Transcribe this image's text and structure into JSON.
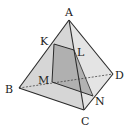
{
  "diagram": {
    "type": "tetrahedron-cross-section",
    "vertices": {
      "A": {
        "label": "A",
        "x": 69,
        "y": 20
      },
      "B": {
        "label": "B",
        "x": 19,
        "y": 88
      },
      "C": {
        "label": "C",
        "x": 84,
        "y": 110
      },
      "D": {
        "label": "D",
        "x": 113,
        "y": 74
      }
    },
    "section_points": {
      "K": {
        "label": "K",
        "on": "AB",
        "x": 54,
        "y": 44
      },
      "L": {
        "label": "L",
        "on": "AC",
        "x": 74,
        "y": 50
      },
      "N": {
        "label": "N",
        "on": "CD",
        "x": 93,
        "y": 96
      },
      "M": {
        "label": "M",
        "on": "BD",
        "x": 52,
        "y": 82
      }
    },
    "section": [
      "K",
      "L",
      "N",
      "M"
    ],
    "hidden_edges": [
      "BD"
    ],
    "colors": {
      "face": "#d8d8d8",
      "face_light": "#e6e6e6",
      "section": "#a8a8a8",
      "edge": "#2a2a2a"
    }
  }
}
